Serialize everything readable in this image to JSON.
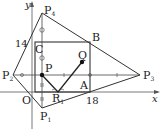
{
  "axes": {
    "x_label": "x",
    "y_label": "y",
    "origin_label": "O"
  },
  "ticks": {
    "y_value": "14",
    "x_value": "18"
  },
  "points": {
    "P4": {
      "name": "P",
      "sub": "4"
    },
    "C": {
      "name": "C"
    },
    "B": {
      "name": "B"
    },
    "Q": {
      "name": "Q"
    },
    "P": {
      "name": "P"
    },
    "P2": {
      "name": "P",
      "sub": "2"
    },
    "P3": {
      "name": "P",
      "sub": "3"
    },
    "A": {
      "name": "A"
    },
    "R1": {
      "name": "R",
      "sub": "1"
    },
    "O": {
      "name": "O"
    },
    "P1": {
      "name": "P",
      "sub": "1"
    }
  },
  "colors": {
    "line": "#333333",
    "axis": "#555555",
    "background": "#ffffff"
  }
}
